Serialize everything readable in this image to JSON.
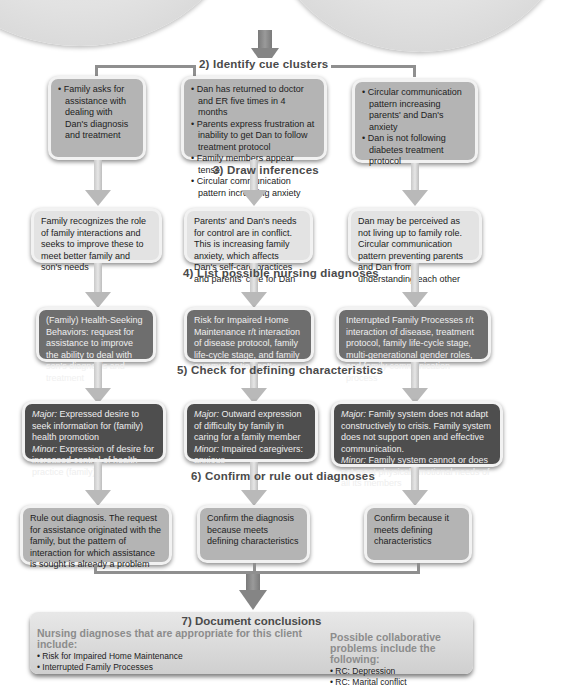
{
  "steps": {
    "step2": "2) Identify cue clusters",
    "step3": "3) Draw inferences",
    "step4": "4) List possible nursing diagnoses",
    "step5": "5) Check for defining characteristics",
    "step6": "6) Confirm or rule out diagnoses",
    "step7": "7) Document conclusions"
  },
  "cue_clusters": [
    {
      "items": [
        "Family asks for assistance with dealing with Dan's diagnosis and treatment"
      ]
    },
    {
      "items": [
        "Dan has returned to doctor and ER five times in 4 months",
        "Parents express frustration at inability to get Dan to follow treatment protocol",
        "Family members appear tense",
        "Circular communication pattern increasing anxiety"
      ]
    },
    {
      "items": [
        "Circular communication pattern increasing parents' and Dan's anxiety",
        "Dan is not following diabetes treatment protocol"
      ]
    }
  ],
  "inferences": [
    "Family recognizes the role of family interactions and seeks to improve these to meet better family and son's needs",
    "Parents' and Dan's needs for control are in conflict. This is increasing family anxiety, which affects Dan's self-care practices and parents' care for Dan",
    "Dan may be perceived as not living up to family role. Circular communication pattern preventing parents and Dan from understanding each other"
  ],
  "diagnoses": [
    "(Family) Health-Seeking Behaviors: request for assistance to improve the ability to deal with son's diagnosis and treatment",
    "Risk for Impaired Home Maintenance r/t interaction of disease protocol, family life-cycle stage, and family communication patterns",
    "Interrupted Family Processes r/t interaction of disease, treatment protocol, family life-cycle stage, multi-generational gender roles, and family communication process"
  ],
  "characteristics": [
    {
      "major_label": "Major:",
      "major": " Expressed desire to seek information for (family) health promotion",
      "minor_label": "Minor:",
      "minor": " Expression of desire for increased control of health practice (family)"
    },
    {
      "major_label": "Major:",
      "major": " Outward expression of difficulty by family in caring for a family member",
      "minor_label": "Minor:",
      "minor": " Impaired caregivers: anxious"
    },
    {
      "major_label": "Major:",
      "major": " Family system does not adapt constructively to crisis. Family system does not support open and effective communication.",
      "minor_label": "Minor:",
      "minor": " Family system cannot or does not meet physical/emotional needs of all its members"
    }
  ],
  "confirmations": [
    "Rule out diagnosis. The request for assistance originated with the family, but the pattern of interaction for which assistance is sought is already a problem",
    "Confirm the diagnosis because meets defining characteristics",
    "Confirm because it meets defining characteristics"
  ],
  "conclusions": {
    "nursing_heading": "Nursing diagnoses that are appropriate for this client include:",
    "nursing_items": [
      "Risk for Impaired Home Maintenance",
      "Interrupted Family Processes"
    ],
    "collab_heading": "Possible collaborative problems include the following:",
    "collab_items": [
      "RC: Depression",
      "RC: Marital conflict"
    ]
  }
}
